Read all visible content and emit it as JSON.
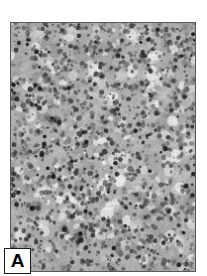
{
  "figure": {
    "panel_letter": "A",
    "image_kind": "histopathology-micrograph",
    "staining_appearance": "grayscale",
    "background_color": "#ffffff",
    "frame_color": "#5a5a5a",
    "label_box_background": "#ffffff",
    "label_box_border_color": "#1a1a1a",
    "label_text_color": "#000000",
    "tissue_mid_tone": "#a8a8a8",
    "tissue_light_tone": "#e2e2e2",
    "tissue_dark_tone": "#2b2b2b"
  },
  "texture": {
    "base_gray": "#ababab",
    "nuclei_count": 1500,
    "nuclei_min_radius": 0.8,
    "nuclei_max_radius": 2.6,
    "blob_count": 520,
    "blob_min_radius": 3,
    "blob_max_radius": 9,
    "highlight_count": 260,
    "noise_strength": 26,
    "seed": 20240517
  }
}
